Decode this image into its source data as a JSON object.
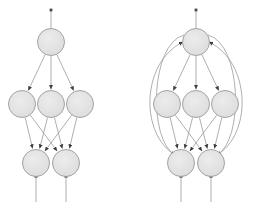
{
  "figure": {
    "title": "",
    "background_color": "#ffffff",
    "width": 262,
    "height": 208
  },
  "style": {
    "node_fill": "#e2e2e2",
    "node_stroke": "#9a9a9a",
    "node_radius": 13.5,
    "edge_color": "#9a9a9a",
    "edge_width": 0.8,
    "arrow_color": "#3d3d3d",
    "terminal_marker_color": "#4a4a4a"
  },
  "diagrams": [
    {
      "name": "feedforward-network",
      "label": "",
      "nodes": [
        {
          "id": "L-top-1",
          "layer": "top",
          "cx": 51,
          "cy": 42,
          "label": ""
        },
        {
          "id": "L-mid-1",
          "layer": "middle",
          "cx": 22,
          "cy": 104,
          "label": ""
        },
        {
          "id": "L-mid-2",
          "layer": "middle",
          "cx": 51,
          "cy": 104,
          "label": ""
        },
        {
          "id": "L-mid-3",
          "layer": "middle",
          "cx": 80,
          "cy": 104,
          "label": ""
        },
        {
          "id": "L-bot-1",
          "layer": "bottom",
          "cx": 36,
          "cy": 163,
          "label": ""
        },
        {
          "id": "L-bot-2",
          "layer": "bottom",
          "cx": 66,
          "cy": 163,
          "label": ""
        }
      ],
      "straight_edges": [
        {
          "from": "L-top-1",
          "to": "L-mid-1"
        },
        {
          "from": "L-top-1",
          "to": "L-mid-2"
        },
        {
          "from": "L-top-1",
          "to": "L-mid-3"
        },
        {
          "from": "L-mid-1",
          "to": "L-bot-1"
        },
        {
          "from": "L-mid-1",
          "to": "L-bot-2"
        },
        {
          "from": "L-mid-2",
          "to": "L-bot-1"
        },
        {
          "from": "L-mid-2",
          "to": "L-bot-2"
        },
        {
          "from": "L-mid-3",
          "to": "L-bot-1"
        },
        {
          "from": "L-mid-3",
          "to": "L-bot-2"
        }
      ],
      "feedback_edges": [],
      "input_stubs": [
        {
          "x": 51,
          "y_from": 10,
          "y_to": 28
        }
      ],
      "output_stubs": [
        {
          "x": 36,
          "y_from": 176,
          "y_to": 202
        },
        {
          "x": 66,
          "y_from": 176,
          "y_to": 202
        }
      ]
    },
    {
      "name": "recurrent-network",
      "label": "",
      "nodes": [
        {
          "id": "R-top-1",
          "layer": "top",
          "cx": 196,
          "cy": 42,
          "label": ""
        },
        {
          "id": "R-mid-1",
          "layer": "middle",
          "cx": 167,
          "cy": 104,
          "label": ""
        },
        {
          "id": "R-mid-2",
          "layer": "middle",
          "cx": 196,
          "cy": 104,
          "label": ""
        },
        {
          "id": "R-mid-3",
          "layer": "middle",
          "cx": 225,
          "cy": 104,
          "label": ""
        },
        {
          "id": "R-bot-1",
          "layer": "bottom",
          "cx": 181,
          "cy": 163,
          "label": ""
        },
        {
          "id": "R-bot-2",
          "layer": "bottom",
          "cx": 211,
          "cy": 163,
          "label": ""
        }
      ],
      "straight_edges": [
        {
          "from": "R-top-1",
          "to": "R-mid-1"
        },
        {
          "from": "R-top-1",
          "to": "R-mid-2"
        },
        {
          "from": "R-top-1",
          "to": "R-mid-3"
        },
        {
          "from": "R-mid-1",
          "to": "R-bot-1"
        },
        {
          "from": "R-mid-1",
          "to": "R-bot-2"
        },
        {
          "from": "R-mid-2",
          "to": "R-bot-1"
        },
        {
          "from": "R-mid-2",
          "to": "R-bot-2"
        },
        {
          "from": "R-mid-3",
          "to": "R-bot-1"
        },
        {
          "from": "R-mid-3",
          "to": "R-bot-2"
        }
      ],
      "feedback_edges": [
        {
          "from": "R-bot-1",
          "to": "R-top-1",
          "side": "left",
          "path": "M 172 153 C 140 130, 142 62, 183 42"
        },
        {
          "from": "R-bot-2",
          "to": "R-top-1",
          "side": "right",
          "path": "M 220 153 C 252 130, 250 62, 209 42"
        },
        {
          "from": "R-top-1",
          "to": "R-bot-1",
          "side": "left",
          "path": "M 184 35 C 150 44, 148 140, 175 155"
        },
        {
          "from": "R-top-1",
          "to": "R-bot-2",
          "side": "right",
          "path": "M 208 35 C 242 44, 244 140, 217 155"
        }
      ],
      "input_stubs": [
        {
          "x": 196,
          "y_from": 10,
          "y_to": 28
        }
      ],
      "output_stubs": [
        {
          "x": 181,
          "y_from": 176,
          "y_to": 202
        },
        {
          "x": 211,
          "y_from": 176,
          "y_to": 202
        }
      ]
    }
  ]
}
